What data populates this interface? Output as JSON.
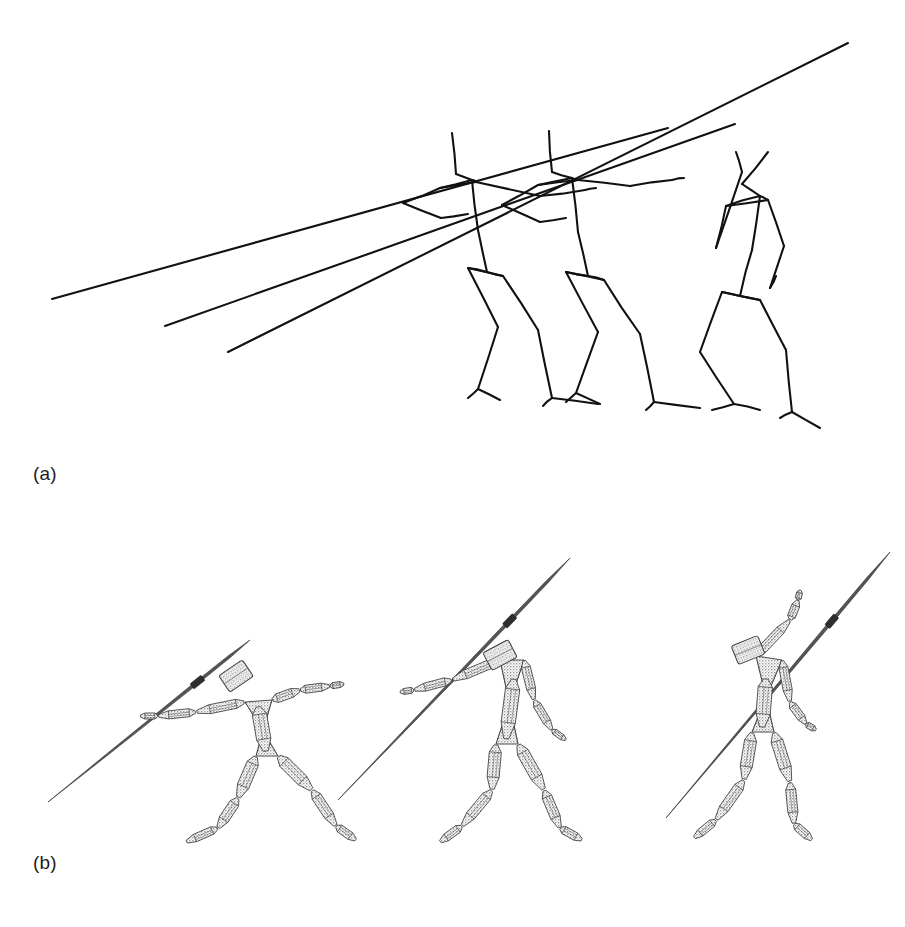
{
  "figure": {
    "kind": "scientific-figure",
    "background_color": "#ffffff",
    "ink_color": "#111111",
    "width": 905,
    "height": 927
  },
  "panels": [
    {
      "id": "a",
      "label": "(a)",
      "label_x": 33,
      "label_y": 463,
      "caption_text": "(a)",
      "content_type": "stick-figure-wireframe-overlay",
      "description": "Superimposed skeletal stick-figure line drawing of three javelin-throw poses with three javelin shafts",
      "stroke_color": "#111111",
      "stroke_width": 2.1,
      "figure_count": 3,
      "javelin_count": 3
    },
    {
      "id": "b",
      "label": "(b)",
      "label_x": 33,
      "label_y": 852,
      "caption_text": "(b)",
      "content_type": "rendered-articulated-humanoid-models",
      "description": "Three shaded 3D wireframe humanoid models holding javelins, shown left to right in throwing sequence",
      "stroke_color": "#3a3a3a",
      "fill_color": "#cccccc",
      "figure_count": 3
    }
  ],
  "panel_a": {
    "javelins": [
      {
        "name": "javelin-1",
        "x1": 52,
        "y1": 299,
        "x2": 668,
        "y2": 128
      },
      {
        "name": "javelin-2",
        "x1": 165,
        "y1": 326,
        "x2": 735,
        "y2": 124
      },
      {
        "name": "javelin-3",
        "x1": 228,
        "y1": 352,
        "x2": 848,
        "y2": 43
      }
    ],
    "skeletons": [
      {
        "name": "skeleton-pose-1",
        "joints": {
          "head_top": [
            452,
            133
          ],
          "head_base": [
            456,
            174
          ],
          "neck": [
            472,
            180
          ],
          "shoulder_r": [
            440,
            188
          ],
          "shoulder_l": [
            476,
            182
          ],
          "elbow_r": [
            403,
            203
          ],
          "wrist_r": [
            441,
            218
          ],
          "hand_r": [
            468,
            214
          ],
          "elbow_l": [
            540,
            196
          ],
          "wrist_l": [
            585,
            190
          ],
          "hand_l": [
            596,
            188
          ],
          "spine_mid": [
            478,
            230
          ],
          "pelvis": [
            487,
            272
          ],
          "hip_r": [
            468,
            268
          ],
          "hip_l": [
            503,
            276
          ],
          "knee_r": [
            498,
            327
          ],
          "ankle_r": [
            478,
            389
          ],
          "toe_r": [
            500,
            400
          ],
          "heel_r": [
            468,
            398
          ],
          "knee_l": [
            538,
            330
          ],
          "ankle_l": [
            552,
            398
          ],
          "toe_l": [
            598,
            404
          ],
          "heel_l": [
            543,
            406
          ]
        },
        "bones": [
          [
            "head_top",
            "head_base"
          ],
          [
            "head_base",
            "neck"
          ],
          [
            "neck",
            "shoulder_r"
          ],
          [
            "neck",
            "shoulder_l"
          ],
          [
            "shoulder_r",
            "elbow_r"
          ],
          [
            "elbow_r",
            "wrist_r"
          ],
          [
            "wrist_r",
            "hand_r"
          ],
          [
            "shoulder_l",
            "elbow_l"
          ],
          [
            "elbow_l",
            "wrist_l"
          ],
          [
            "wrist_l",
            "hand_l"
          ],
          [
            "neck",
            "spine_mid"
          ],
          [
            "spine_mid",
            "pelvis"
          ],
          [
            "pelvis",
            "hip_r"
          ],
          [
            "pelvis",
            "hip_l"
          ],
          [
            "hip_r",
            "knee_r"
          ],
          [
            "knee_r",
            "ankle_r"
          ],
          [
            "ankle_r",
            "toe_r"
          ],
          [
            "ankle_r",
            "heel_r"
          ],
          [
            "hip_l",
            "knee_l"
          ],
          [
            "knee_l",
            "ankle_l"
          ],
          [
            "ankle_l",
            "toe_l"
          ],
          [
            "ankle_l",
            "heel_l"
          ],
          [
            "shoulder_r",
            "shoulder_l"
          ],
          [
            "hip_r",
            "hip_l"
          ]
        ]
      },
      {
        "name": "skeleton-pose-2",
        "joints": {
          "head_top": [
            549,
            131
          ],
          "head_base": [
            552,
            172
          ],
          "neck": [
            572,
            178
          ],
          "shoulder_r": [
            538,
            185
          ],
          "shoulder_l": [
            578,
            180
          ],
          "elbow_r": [
            502,
            205
          ],
          "wrist_r": [
            540,
            222
          ],
          "hand_r": [
            566,
            218
          ],
          "elbow_l": [
            630,
            186
          ],
          "wrist_l": [
            672,
            180
          ],
          "hand_l": [
            684,
            178
          ],
          "spine_mid": [
            578,
            232
          ],
          "pelvis": [
            588,
            276
          ],
          "hip_r": [
            566,
            272
          ],
          "hip_l": [
            604,
            280
          ],
          "knee_r": [
            598,
            332
          ],
          "ankle_r": [
            576,
            393
          ],
          "toe_r": [
            600,
            404
          ],
          "heel_r": [
            566,
            402
          ],
          "knee_l": [
            640,
            334
          ],
          "ankle_l": [
            654,
            402
          ],
          "toe_l": [
            700,
            408
          ],
          "heel_l": [
            646,
            410
          ]
        },
        "bones": [
          [
            "head_top",
            "head_base"
          ],
          [
            "head_base",
            "neck"
          ],
          [
            "neck",
            "shoulder_r"
          ],
          [
            "neck",
            "shoulder_l"
          ],
          [
            "shoulder_r",
            "elbow_r"
          ],
          [
            "elbow_r",
            "wrist_r"
          ],
          [
            "wrist_r",
            "hand_r"
          ],
          [
            "shoulder_l",
            "elbow_l"
          ],
          [
            "elbow_l",
            "wrist_l"
          ],
          [
            "wrist_l",
            "hand_l"
          ],
          [
            "neck",
            "spine_mid"
          ],
          [
            "spine_mid",
            "pelvis"
          ],
          [
            "pelvis",
            "hip_r"
          ],
          [
            "pelvis",
            "hip_l"
          ],
          [
            "hip_r",
            "knee_r"
          ],
          [
            "knee_r",
            "ankle_r"
          ],
          [
            "ankle_r",
            "toe_r"
          ],
          [
            "ankle_r",
            "heel_r"
          ],
          [
            "hip_l",
            "knee_l"
          ],
          [
            "knee_l",
            "ankle_l"
          ],
          [
            "ankle_l",
            "toe_l"
          ],
          [
            "ankle_l",
            "heel_l"
          ],
          [
            "shoulder_r",
            "shoulder_l"
          ],
          [
            "hip_r",
            "hip_l"
          ]
        ]
      },
      {
        "name": "skeleton-pose-3",
        "joints": {
          "head_top": [
            768,
            152
          ],
          "head_base": [
            742,
            184
          ],
          "neck": [
            760,
            196
          ],
          "shoulder_r": [
            726,
            206
          ],
          "shoulder_l": [
            768,
            200
          ],
          "elbow_r": [
            716,
            248
          ],
          "wrist_r": [
            742,
            172
          ],
          "hand_r": [
            736,
            152
          ],
          "elbow_l": [
            784,
            246
          ],
          "wrist_l": [
            770,
            288
          ],
          "hand_l": [
            776,
            276
          ],
          "spine_mid": [
            752,
            250
          ],
          "pelvis": [
            740,
            296
          ],
          "hip_r": [
            722,
            292
          ],
          "hip_l": [
            760,
            300
          ],
          "knee_r": [
            700,
            352
          ],
          "ankle_r": [
            734,
            404
          ],
          "toe_r": [
            760,
            410
          ],
          "heel_r": [
            712,
            410
          ],
          "knee_l": [
            786,
            350
          ],
          "ankle_l": [
            792,
            412
          ],
          "toe_l": [
            820,
            428
          ],
          "heel_l": [
            780,
            418
          ]
        },
        "bones": [
          [
            "head_top",
            "head_base"
          ],
          [
            "head_base",
            "neck"
          ],
          [
            "neck",
            "shoulder_r"
          ],
          [
            "neck",
            "shoulder_l"
          ],
          [
            "shoulder_r",
            "elbow_r"
          ],
          [
            "elbow_r",
            "wrist_r"
          ],
          [
            "wrist_r",
            "hand_r"
          ],
          [
            "shoulder_l",
            "elbow_l"
          ],
          [
            "elbow_l",
            "wrist_l"
          ],
          [
            "wrist_l",
            "hand_l"
          ],
          [
            "neck",
            "spine_mid"
          ],
          [
            "spine_mid",
            "pelvis"
          ],
          [
            "pelvis",
            "hip_r"
          ],
          [
            "pelvis",
            "hip_l"
          ],
          [
            "hip_r",
            "knee_r"
          ],
          [
            "knee_r",
            "ankle_r"
          ],
          [
            "ankle_r",
            "toe_r"
          ],
          [
            "ankle_r",
            "heel_r"
          ],
          [
            "hip_l",
            "knee_l"
          ],
          [
            "knee_l",
            "ankle_l"
          ],
          [
            "ankle_l",
            "toe_l"
          ],
          [
            "ankle_l",
            "heel_l"
          ],
          [
            "shoulder_r",
            "shoulder_l"
          ],
          [
            "hip_r",
            "hip_l"
          ]
        ]
      }
    ]
  },
  "panel_b": {
    "models": [
      {
        "name": "humanoid-model-1",
        "order": 1,
        "origin_x": 0,
        "javelin": {
          "x1": 48,
          "y1": 802,
          "x2": 250,
          "y2": 640
        },
        "joints": {
          "head_c": [
            236,
            676
          ],
          "neck": [
            262,
            700
          ],
          "shoulder_r": [
            245,
            702
          ],
          "shoulder_l": [
            272,
            700
          ],
          "elbow_r": [
            196,
            712
          ],
          "wrist_r": [
            158,
            716
          ],
          "hand_r": [
            140,
            716
          ],
          "elbow_l": [
            300,
            690
          ],
          "wrist_l": [
            330,
            686
          ],
          "hand_l": [
            344,
            684
          ],
          "chest": [
            258,
            706
          ],
          "pelvis": [
            266,
            752
          ],
          "hip_r": [
            256,
            756
          ],
          "hip_l": [
            278,
            756
          ],
          "knee_r": [
            238,
            798
          ],
          "ankle_r": [
            218,
            828
          ],
          "toe_r": [
            186,
            842
          ],
          "knee_l": [
            312,
            790
          ],
          "ankle_l": [
            336,
            826
          ],
          "toe_l": [
            356,
            840
          ]
        },
        "limb_widths": {
          "head": 19,
          "upper_arm": 9,
          "fore_arm": 8,
          "hand": 6,
          "thigh": 12,
          "shin": 10,
          "foot": 8,
          "torso": 26
        }
      },
      {
        "name": "humanoid-model-2",
        "order": 2,
        "origin_x": 0,
        "javelin": {
          "x1": 338,
          "y1": 800,
          "x2": 570,
          "y2": 558
        },
        "joints": {
          "head_c": [
            500,
            655
          ],
          "neck": [
            516,
            662
          ],
          "shoulder_r": [
            500,
            660
          ],
          "shoulder_l": [
            524,
            660
          ],
          "elbow_r": [
            452,
            680
          ],
          "wrist_r": [
            414,
            690
          ],
          "hand_r": [
            400,
            692
          ],
          "elbow_l": [
            534,
            700
          ],
          "wrist_l": [
            552,
            730
          ],
          "hand_l": [
            566,
            740
          ],
          "chest": [
            514,
            678
          ],
          "pelvis": [
            506,
            740
          ],
          "hip_r": [
            496,
            744
          ],
          "hip_l": [
            518,
            744
          ],
          "knee_r": [
            492,
            790
          ],
          "ankle_r": [
            462,
            826
          ],
          "toe_r": [
            440,
            842
          ],
          "knee_l": [
            544,
            790
          ],
          "ankle_l": [
            560,
            828
          ],
          "toe_l": [
            582,
            840
          ]
        },
        "limb_widths": {
          "head": 19,
          "upper_arm": 9,
          "fore_arm": 8,
          "hand": 6,
          "thigh": 12,
          "shin": 10,
          "foot": 8,
          "torso": 26
        }
      },
      {
        "name": "humanoid-model-3",
        "order": 3,
        "origin_x": 0,
        "javelin": {
          "x1": 666,
          "y1": 818,
          "x2": 890,
          "y2": 552
        },
        "joints": {
          "head_c": [
            748,
            650
          ],
          "neck": [
            772,
            660
          ],
          "shoulder_r": [
            756,
            656
          ],
          "shoulder_l": [
            782,
            660
          ],
          "elbow_r": [
            790,
            620
          ],
          "wrist_r": [
            798,
            600
          ],
          "hand_r": [
            800,
            590
          ],
          "elbow_l": [
            790,
            702
          ],
          "wrist_l": [
            806,
            724
          ],
          "hand_l": [
            816,
            730
          ],
          "chest": [
            766,
            678
          ],
          "pelvis": [
            762,
            728
          ],
          "hip_r": [
            752,
            732
          ],
          "hip_l": [
            774,
            732
          ],
          "knee_r": [
            744,
            780
          ],
          "ankle_r": [
            716,
            820
          ],
          "toe_r": [
            694,
            838
          ],
          "knee_l": [
            790,
            782
          ],
          "ankle_l": [
            794,
            824
          ],
          "toe_l": [
            812,
            840
          ]
        },
        "limb_widths": {
          "head": 19,
          "upper_arm": 9,
          "fore_arm": 8,
          "hand": 6,
          "thigh": 12,
          "shin": 10,
          "foot": 8,
          "torso": 26
        }
      }
    ]
  }
}
